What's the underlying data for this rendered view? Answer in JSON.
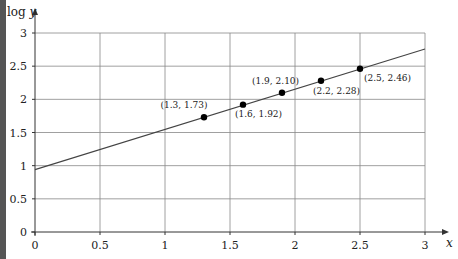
{
  "chart_data": {
    "type": "scatter",
    "title": "",
    "xlabel": "x",
    "ylabel": "log y",
    "xlim": [
      0,
      3
    ],
    "ylim": [
      0,
      3
    ],
    "grid": true,
    "x_ticks": [
      "0",
      "0.5",
      "1",
      "1.5",
      "2",
      "2.5",
      "3"
    ],
    "y_ticks": [
      "0",
      "0.5",
      "1",
      "1.5",
      "2",
      "2.5",
      "3"
    ],
    "points": [
      {
        "x": 1.3,
        "y": 1.73,
        "label": "(1.3, 1.73)"
      },
      {
        "x": 1.6,
        "y": 1.92,
        "label": "(1.6, 1.92)"
      },
      {
        "x": 1.9,
        "y": 2.1,
        "label": "(1.9, 2.10)"
      },
      {
        "x": 2.2,
        "y": 2.28,
        "label": "(2.2, 2.28)"
      },
      {
        "x": 2.5,
        "y": 2.46,
        "label": "(2.5, 2.46)"
      }
    ],
    "line": {
      "x": [
        0,
        3
      ],
      "y": [
        0.94,
        2.76
      ]
    },
    "colors": {
      "grid": "#888888",
      "axis": "#333333",
      "line": "#444444",
      "points": "#000000"
    }
  }
}
